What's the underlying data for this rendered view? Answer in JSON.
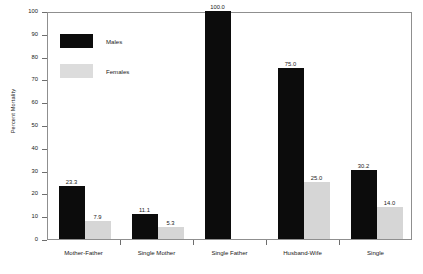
{
  "chart_data": {
    "type": "bar",
    "title": "",
    "subtitle": "",
    "xlabel": "",
    "ylabel": "Percent Mortality",
    "ylim": [
      0,
      100
    ],
    "yticks": [
      0,
      10,
      20,
      30,
      40,
      50,
      60,
      70,
      80,
      90,
      100
    ],
    "ytick_labels": [
      "0",
      "10",
      "20",
      "30",
      "40",
      "50",
      "60",
      "70",
      "80",
      "90",
      "100"
    ],
    "grid": false,
    "legend_position": "upper-left-inside",
    "categories": [
      "Mother-Father",
      "Single Mother",
      "Single Father",
      "Husband-Wife",
      "Single"
    ],
    "series": [
      {
        "name": "Males",
        "color": "#0c0c0c",
        "values": [
          23.3,
          11.1,
          100.0,
          75.0,
          30.2
        ],
        "labels": [
          "23.3",
          "11.1",
          "100.0",
          "75.0",
          "30.2"
        ]
      },
      {
        "name": "Females",
        "color": "#d6d6d6",
        "values": [
          7.9,
          5.3,
          null,
          25.0,
          14.0
        ],
        "labels": [
          "7.9",
          "5.3",
          "",
          "25.0",
          "14.0"
        ]
      }
    ],
    "annotations": []
  },
  "legend": {
    "entries": [
      {
        "label": "Males",
        "swatch": "males"
      },
      {
        "label": "Females",
        "swatch": "females"
      }
    ]
  },
  "axes": {
    "y_title": "Percent Mortality"
  }
}
